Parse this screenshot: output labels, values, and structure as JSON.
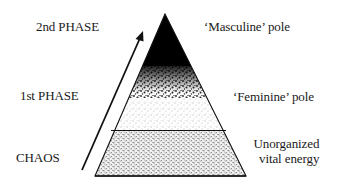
{
  "diagram": {
    "type": "layered-pyramid",
    "left_labels": {
      "phase2": "2nd PHASE",
      "phase1": "1st PHASE",
      "chaos": "CHAOS"
    },
    "right_labels": {
      "masculine": "‘Masculine’ pole",
      "feminine": "‘Feminine’ pole",
      "unorganized_line1": "Unorganized",
      "unorganized_line2": "vital energy"
    },
    "layers": [
      {
        "name": "Masculine pole",
        "fill": "solid black"
      },
      {
        "name": "Feminine pole",
        "fill": "fading stipple"
      },
      {
        "name": "Unorganized vital energy",
        "fill": "dense textured stipple"
      }
    ],
    "arrow": {
      "direction": "upward",
      "meaning": "progression from chaos to 2nd phase"
    },
    "colors": {
      "ink": "#111111",
      "background": "#ffffff"
    }
  }
}
